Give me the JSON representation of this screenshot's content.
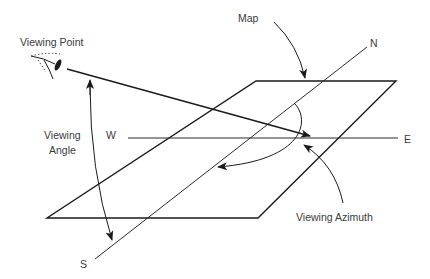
{
  "diagram": {
    "type": "viewing-geometry",
    "labels": {
      "viewing_point": "Viewing Point",
      "map": "Map",
      "north": "N",
      "south": "S",
      "east": "E",
      "west": "W",
      "viewing_angle_line1": "Viewing",
      "viewing_angle_line2": "Angle",
      "viewing_azimuth": "Viewing Azimuth"
    },
    "elements": [
      {
        "id": "map-plane",
        "shape": "parallelogram"
      },
      {
        "id": "north-south-axis",
        "shape": "line"
      },
      {
        "id": "west-east-axis",
        "shape": "line"
      },
      {
        "id": "line-of-sight",
        "shape": "arrow",
        "from": "viewing-point",
        "to": "map-center"
      },
      {
        "id": "viewing-angle-arc",
        "shape": "double-arrow-arc"
      },
      {
        "id": "viewing-azimuth-arc",
        "shape": "arrow-arc"
      },
      {
        "id": "eye-icon",
        "shape": "eye"
      }
    ],
    "colors": {
      "stroke": "#1a1a1a",
      "text": "#3a3a3a",
      "background": "#ffffff"
    }
  }
}
